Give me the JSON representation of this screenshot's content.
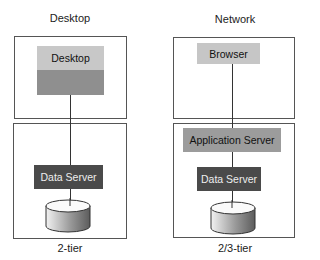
{
  "diagram": {
    "left": {
      "title": "Desktop",
      "upper_block": {
        "label": "Desktop",
        "top_color": "#c8c8c8",
        "bottom_color": "#8f8f8f"
      },
      "data_server": {
        "label": "Data Server",
        "color": "#4a4a4a"
      },
      "database": "database-cylinder",
      "caption": "2-tier"
    },
    "right": {
      "title": "Network",
      "browser": {
        "label": "Browser",
        "color": "#c6c6c6"
      },
      "app_server": {
        "label": "Application Server",
        "color": "#9c9c9c"
      },
      "data_server": {
        "label": "Data Server",
        "color": "#4a4a4a"
      },
      "database": "database-cylinder",
      "caption": "2/3-tier"
    }
  }
}
